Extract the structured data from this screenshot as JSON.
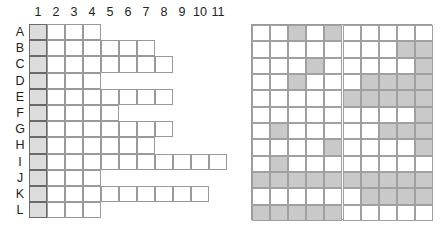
{
  "left_grid": {
    "column_labels": [
      "1",
      "2",
      "3",
      "4",
      "5",
      "6",
      "7",
      "8",
      "9",
      "10",
      "11"
    ],
    "rows": [
      {
        "label": "A",
        "length": 4
      },
      {
        "label": "B",
        "length": 7
      },
      {
        "label": "C",
        "length": 8
      },
      {
        "label": "D",
        "length": 4
      },
      {
        "label": "E",
        "length": 8
      },
      {
        "label": "F",
        "length": 5
      },
      {
        "label": "G",
        "length": 8
      },
      {
        "label": "H",
        "length": 7
      },
      {
        "label": "I",
        "length": 11
      },
      {
        "label": "J",
        "length": 4
      },
      {
        "label": "K",
        "length": 10
      },
      {
        "label": "L",
        "length": 4
      }
    ],
    "shaded_column": 1,
    "colors": {
      "shaded": "#dcdcdc",
      "border": "#9a9a9a"
    }
  },
  "right_grid": {
    "columns": 10,
    "rows": 12,
    "shaded_cells": [
      [
        3,
        5
      ],
      [
        9,
        10
      ],
      [
        4,
        10
      ],
      [
        3,
        7,
        8,
        9,
        10
      ],
      [
        6,
        7,
        8,
        9,
        10
      ],
      [
        10
      ],
      [
        2,
        8,
        9,
        10
      ],
      [
        5,
        10
      ],
      [
        2
      ],
      [
        1,
        2,
        3,
        4,
        5,
        6,
        7,
        8,
        9,
        10
      ],
      [
        7,
        8,
        9,
        10
      ],
      [
        1,
        2,
        3,
        4,
        5
      ]
    ],
    "colors": {
      "shaded": "#c9c9c9",
      "border": "#a0a0a0"
    }
  }
}
